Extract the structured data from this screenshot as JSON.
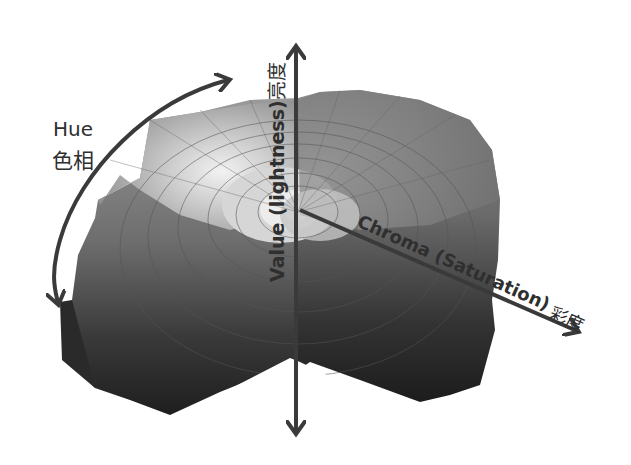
{
  "diagram": {
    "colors": {
      "background": "#ffffff",
      "arrow": "#3a3a3a",
      "text": "#2f2f2f",
      "top_light": "#d9d9d9",
      "mid": "#8a8a8a",
      "dark": "#2a2a2a"
    },
    "axes": {
      "hue": {
        "label_en": "Hue",
        "label_zh": "色相",
        "icon": "curved-double-arrow"
      },
      "value": {
        "label": "Value (lightness)",
        "label_zh": "亮度",
        "icon": "vertical-double-arrow"
      },
      "chroma": {
        "label": "Chroma (Saturation)",
        "label_zh": "彩度",
        "icon": "diagonal-arrow"
      }
    }
  }
}
